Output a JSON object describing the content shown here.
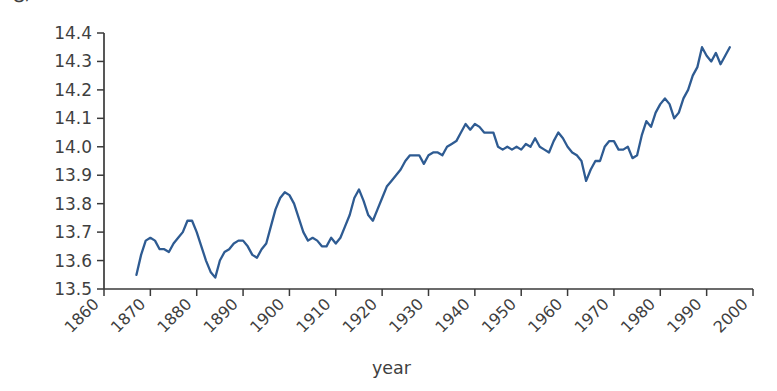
{
  "chart_data": {
    "type": "line",
    "title": "",
    "xlabel": "year",
    "ylabel": "global average air temperature (°C)",
    "xlim": [
      1860,
      2000
    ],
    "ylim": [
      13.5,
      14.4
    ],
    "grid": false,
    "legend": false,
    "line_color": "#2e5b92",
    "axis_color": "#3a3a3a",
    "x_ticks": [
      1860,
      1870,
      1880,
      1890,
      1900,
      1910,
      1920,
      1930,
      1940,
      1950,
      1960,
      1970,
      1980,
      1990,
      2000
    ],
    "x_tick_labels": [
      "1860",
      "1870",
      "1880",
      "1890",
      "1900",
      "1910",
      "1920",
      "1930",
      "1940",
      "1950",
      "1960",
      "1970",
      "1980",
      "1990",
      "2000"
    ],
    "x_tick_rotation": 45,
    "y_ticks": [
      13.5,
      13.6,
      13.7,
      13.8,
      13.9,
      14.0,
      14.1,
      14.2,
      14.3,
      14.4
    ],
    "y_tick_labels": [
      "13.5",
      "13.6",
      "13.7",
      "13.8",
      "13.9",
      "14.0",
      "14.1",
      "14.2",
      "14.3",
      "14.4"
    ],
    "series_name": "global average air temperature",
    "x": [
      1867,
      1868,
      1869,
      1870,
      1871,
      1872,
      1873,
      1874,
      1875,
      1876,
      1877,
      1878,
      1879,
      1880,
      1881,
      1882,
      1883,
      1884,
      1885,
      1886,
      1887,
      1888,
      1889,
      1890,
      1891,
      1892,
      1893,
      1894,
      1895,
      1896,
      1897,
      1898,
      1899,
      1900,
      1901,
      1902,
      1903,
      1904,
      1905,
      1906,
      1907,
      1908,
      1909,
      1910,
      1911,
      1912,
      1913,
      1914,
      1915,
      1916,
      1917,
      1918,
      1919,
      1920,
      1921,
      1922,
      1923,
      1924,
      1925,
      1926,
      1927,
      1928,
      1929,
      1930,
      1931,
      1932,
      1933,
      1934,
      1935,
      1936,
      1937,
      1938,
      1939,
      1940,
      1941,
      1942,
      1943,
      1944,
      1945,
      1946,
      1947,
      1948,
      1949,
      1950,
      1951,
      1952,
      1953,
      1954,
      1955,
      1956,
      1957,
      1958,
      1959,
      1960,
      1961,
      1962,
      1963,
      1964,
      1965,
      1966,
      1967,
      1968,
      1969,
      1970,
      1971,
      1972,
      1973,
      1974,
      1975,
      1976,
      1977,
      1978,
      1979,
      1980,
      1981,
      1982,
      1983,
      1984,
      1985,
      1986,
      1987,
      1988,
      1989,
      1990,
      1991,
      1992,
      1993,
      1994,
      1995
    ],
    "y": [
      13.55,
      13.62,
      13.67,
      13.68,
      13.67,
      13.64,
      13.64,
      13.63,
      13.66,
      13.68,
      13.7,
      13.74,
      13.74,
      13.7,
      13.65,
      13.6,
      13.56,
      13.54,
      13.6,
      13.63,
      13.64,
      13.66,
      13.67,
      13.67,
      13.65,
      13.62,
      13.61,
      13.64,
      13.66,
      13.72,
      13.78,
      13.82,
      13.84,
      13.83,
      13.8,
      13.75,
      13.7,
      13.67,
      13.68,
      13.67,
      13.65,
      13.65,
      13.68,
      13.66,
      13.68,
      13.72,
      13.76,
      13.82,
      13.85,
      13.81,
      13.76,
      13.74,
      13.78,
      13.82,
      13.86,
      13.88,
      13.9,
      13.92,
      13.95,
      13.97,
      13.97,
      13.97,
      13.94,
      13.97,
      13.98,
      13.98,
      13.97,
      14.0,
      14.01,
      14.02,
      14.05,
      14.08,
      14.06,
      14.08,
      14.07,
      14.05,
      14.05,
      14.05,
      14.0,
      13.99,
      14.0,
      13.99,
      14.0,
      13.99,
      14.01,
      14.0,
      14.03,
      14.0,
      13.99,
      13.98,
      14.02,
      14.05,
      14.03,
      14.0,
      13.98,
      13.97,
      13.95,
      13.88,
      13.92,
      13.95,
      13.95,
      14.0,
      14.02,
      14.02,
      13.99,
      13.99,
      14.0,
      13.96,
      13.97,
      14.04,
      14.09,
      14.07,
      14.12,
      14.15,
      14.17,
      14.15,
      14.1,
      14.12,
      14.17,
      14.2,
      14.25,
      14.28,
      14.35,
      14.32,
      14.3,
      14.33,
      14.29,
      14.32,
      14.35,
      14.38
    ]
  }
}
